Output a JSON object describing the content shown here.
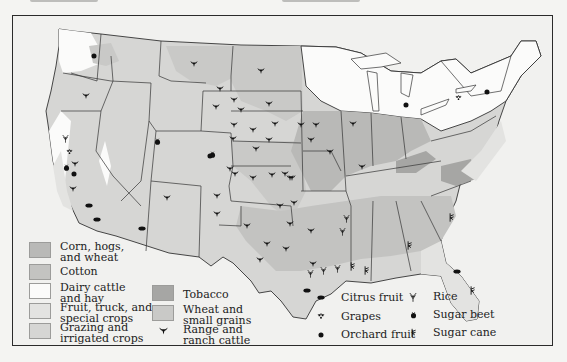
{
  "header": {
    "left_caption": "",
    "center_caption": ""
  },
  "map": {
    "title": "Agricultural regions of the United States",
    "colors": {
      "frame_background": "#f1f1ef",
      "corn_hogs_wheat": "#b9b9b7",
      "cotton": "#c3c3c1",
      "dairy_cattle_hay": "#fbfbfa",
      "fruit_truck_special": "#e3e3e1",
      "grazing_irrigated": "#d6d6d4",
      "tobacco": "#a6a6a4",
      "wheat_small_grains": "#c9c9c7",
      "border": "#333333"
    }
  },
  "legend": {
    "regions": [
      {
        "label": "Corn, hogs,\nand wheat",
        "color": "#b9b9b7"
      },
      {
        "label": "Cotton",
        "color": "#c3c3c1"
      },
      {
        "label": "Dairy cattle\nand hay",
        "color": "#fbfbfa"
      },
      {
        "label": "Fruit, truck, and\nspecial crops",
        "color": "#e3e3e1"
      },
      {
        "label": "Grazing and\nirrigated crops",
        "color": "#d6d6d4"
      },
      {
        "label": "Tobacco",
        "color": "#a6a6a4"
      },
      {
        "label": "Wheat and\nsmall grains",
        "color": "#c9c9c7"
      },
      {
        "label": "Range and\nranch cattle",
        "icon": "cattle-icon"
      }
    ],
    "symbols": [
      {
        "label": "Citrus fruit",
        "icon": "citrus-fruit-icon"
      },
      {
        "label": "Grapes",
        "icon": "grapes-icon"
      },
      {
        "label": "Orchard fruit",
        "icon": "orchard-fruit-icon"
      },
      {
        "label": "Rice",
        "icon": "rice-icon"
      },
      {
        "label": "Sugar beet",
        "icon": "sugar-beet-icon"
      },
      {
        "label": "Sugar cane",
        "icon": "sugar-cane-icon"
      }
    ]
  }
}
